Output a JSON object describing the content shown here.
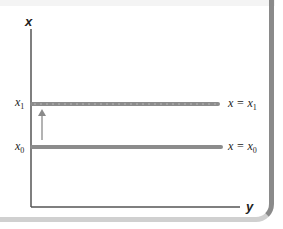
{
  "diagram": {
    "axes": {
      "vertical_label": "x",
      "horizontal_label": "y"
    },
    "lines": [
      {
        "name": "x1-line",
        "axis_label": "x",
        "axis_sub": "1",
        "eq_left": "x = x",
        "eq_sub": "1"
      },
      {
        "name": "x0-line",
        "axis_label": "x",
        "axis_sub": "0",
        "eq_left": "x = x",
        "eq_sub": "0"
      }
    ],
    "arrow": {
      "from": "x0",
      "to": "x1",
      "direction": "up"
    },
    "colors": {
      "line": "#8c8c8c",
      "axis": "#555555",
      "arrow": "#9a9a9a",
      "frame_right": "#8a8a8a",
      "frame_bottom": "#d0d0d0"
    }
  }
}
